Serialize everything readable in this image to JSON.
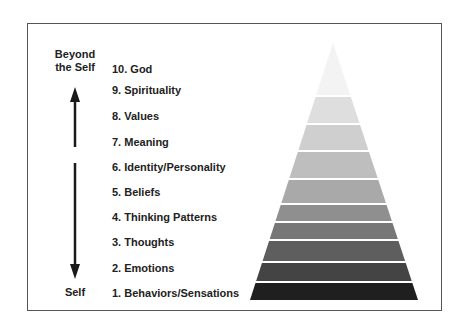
{
  "diagram": {
    "type": "pyramid",
    "top_label": "Beyond the Self",
    "top_label_line1": "Beyond",
    "top_label_line2": "the Self",
    "bottom_label": "Self",
    "levels": [
      {
        "label": "10. God",
        "color": "#f3f3f3"
      },
      {
        "label": "9. Spirituality",
        "color": "#dedede"
      },
      {
        "label": "8. Values",
        "color": "#cfcfcf"
      },
      {
        "label": "7. Meaning",
        "color": "#bebebe"
      },
      {
        "label": "6. Identity/Personality",
        "color": "#a9a9a9"
      },
      {
        "label": "5. Beliefs",
        "color": "#8f8f8f"
      },
      {
        "label": "4. Thinking Patterns",
        "color": "#777777"
      },
      {
        "label": "3. Thoughts",
        "color": "#5e5e5e"
      },
      {
        "label": "2. Emotions",
        "color": "#444444"
      },
      {
        "label": "1. Behaviors/Sensations",
        "color": "#1f1f1f"
      }
    ]
  }
}
